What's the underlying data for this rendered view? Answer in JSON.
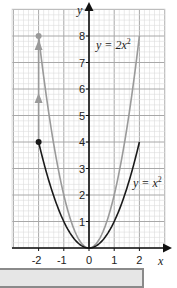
{
  "chart_data": {
    "type": "line",
    "title": "",
    "xlabel": "x",
    "ylabel": "y",
    "xlim": [
      -3,
      3
    ],
    "ylim": [
      0,
      9
    ],
    "grid": true,
    "x_ticks": [
      "-2",
      "-1",
      "0",
      "1",
      "2"
    ],
    "y_ticks": [
      "1",
      "2",
      "3",
      "4",
      "5",
      "6",
      "7",
      "8"
    ],
    "series": [
      {
        "name": "y = x²",
        "label_text": "y = x",
        "label_exp": "2",
        "color": "#1a1a1a",
        "x": [
          -2,
          -1.5,
          -1,
          -0.5,
          0,
          0.5,
          1,
          1.5,
          2
        ],
        "y": [
          4,
          2.25,
          1,
          0.25,
          0,
          0.25,
          1,
          2.25,
          4
        ]
      },
      {
        "name": "y = 2x²",
        "label_text": "y = 2x",
        "label_exp": "2",
        "color": "#9a9a9a",
        "x": [
          -2,
          -1.5,
          -1,
          -0.5,
          0,
          0.5,
          1,
          1.5,
          2
        ],
        "y": [
          8,
          4.5,
          2,
          0.5,
          0,
          0.5,
          2,
          4.5,
          8
        ]
      }
    ],
    "annotations": [
      {
        "type": "point",
        "x": -2,
        "y": 4,
        "color": "#1a1a1a"
      },
      {
        "type": "point",
        "x": -2,
        "y": 8,
        "color": "#9a9a9a"
      },
      {
        "type": "arrow",
        "from": [
          -2,
          4
        ],
        "to": [
          -2,
          8
        ],
        "color": "#9a9a9a",
        "note": "vertical stretch, double arrowheads"
      }
    ]
  },
  "axes": {
    "x_name": "x",
    "y_name": "y"
  },
  "labels": {
    "curve1_text": "y = x",
    "curve1_exp": "2",
    "curve2_text": "y = 2x",
    "curve2_exp": "2"
  },
  "ticks": {
    "x": [
      "-2",
      "-1",
      "0",
      "1",
      "2"
    ],
    "y": [
      "1",
      "2",
      "3",
      "4",
      "5",
      "6",
      "7",
      "8"
    ]
  },
  "colors": {
    "grid_minor": "#dcdcdc",
    "grid_major": "#a8a8a8",
    "axis": "#111111",
    "curve_x2": "#1a1a1a",
    "curve_2x2": "#9a9a9a",
    "caption_fill": "#e6e6e6",
    "caption_border": "#8a8a8a"
  }
}
